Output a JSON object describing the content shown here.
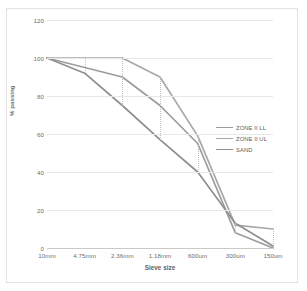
{
  "chart_data": {
    "type": "line",
    "title": "",
    "xlabel": "Sieve size",
    "ylabel": "% passing",
    "categories": [
      "10mm",
      "4.75mm",
      "2.36mm",
      "1.18mm",
      "600um",
      "300um",
      "150um"
    ],
    "ylim": [
      0,
      120
    ],
    "yticks": [
      0,
      20,
      40,
      60,
      80,
      100,
      120
    ],
    "grid": "horizontal-gridlines-and-vertical-dotted",
    "legend_position": "right-middle",
    "series": [
      {
        "name": "ZONE II LL",
        "color": "#9c9c9c",
        "values": [
          100,
          95,
          90,
          75,
          55,
          8,
          0
        ]
      },
      {
        "name": "ZONE II UL",
        "color": "#a8a8a8",
        "values": [
          100,
          100,
          100,
          90,
          59,
          12,
          10
        ]
      },
      {
        "name": "SAND",
        "color": "#8f8f8f",
        "values": [
          100,
          92,
          75,
          57,
          40,
          13,
          1
        ]
      }
    ]
  },
  "axis": {
    "y_tick_labels": [
      "0",
      "20",
      "40",
      "60",
      "80",
      "100",
      "120"
    ],
    "x_tick_labels": [
      "10mm",
      "4.75mm",
      "2.36mm",
      "1.18mm",
      "600um",
      "300um",
      "150um"
    ],
    "y_title": "% passing",
    "x_title": "Sieve size"
  },
  "legend": {
    "items": [
      {
        "label": "ZONE II LL",
        "color": "#9c9c9c"
      },
      {
        "label": "ZONE II UL",
        "color": "#a8a8a8"
      },
      {
        "label": "SAND",
        "color": "#8f8f8f"
      }
    ]
  },
  "colors": {
    "grid": "#e8e8e8",
    "axis": "#c9c9c9",
    "frame": "#e2e2e2",
    "tick_text": "#6e6e6e",
    "background": "#ffffff"
  }
}
